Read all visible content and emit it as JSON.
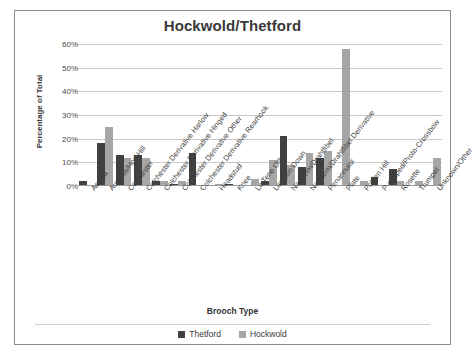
{
  "chart_data": {
    "type": "bar",
    "title": "Hockwold/Thetford",
    "xlabel": "Brooch Type",
    "ylabel": "Percentage of Total",
    "ylim": [
      0,
      60
    ],
    "yticks": [
      "0%",
      "10%",
      "20%",
      "30%",
      "40%",
      "50%",
      "60%"
    ],
    "ytick_values": [
      0,
      10,
      20,
      30,
      40,
      50,
      60
    ],
    "grid": true,
    "legend_position": "bottom",
    "categories": [
      "Aesica",
      "Aucissa/Hod Hill",
      "Colchester",
      "Colchester Derivative Harlow",
      "Colchester Derivative Hinged",
      "Colchester Derivative Other",
      "Colchester Derivative Rearhook",
      "Headstud",
      "Knee",
      "La Tene Other",
      "Langton Down",
      "Nauheim/Drahtfibel",
      "Nauheim/Drahtfibel Derivative",
      "Penannular",
      "Plate",
      "Polden Hill",
      "P-shaped/Proto-Crossbow",
      "Rosette",
      "Trumpet",
      "Unknown/Other"
    ],
    "series": [
      {
        "name": "Thetford",
        "color": "#404040",
        "values": [
          2,
          18,
          13,
          13,
          2,
          1,
          14,
          0,
          1,
          0,
          2,
          21,
          8,
          12,
          0,
          0,
          4,
          7,
          0,
          0
        ]
      },
      {
        "name": "Hockwold",
        "color": "#a6a6a6",
        "values": [
          0,
          25,
          12,
          12,
          2,
          2,
          0,
          1,
          0,
          3,
          11,
          9,
          14,
          15,
          58,
          2,
          0,
          2,
          2,
          12
        ]
      }
    ]
  }
}
